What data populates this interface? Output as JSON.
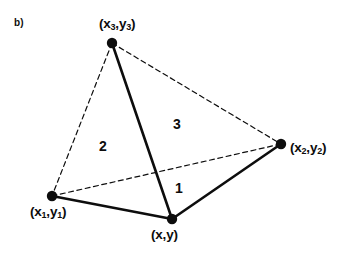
{
  "figure": {
    "panel_letter": "b)",
    "background_color": "#ffffff",
    "stroke_color": "#0d0d0d",
    "vertices": [
      {
        "id": "v3",
        "name": "x3y3",
        "label_text": "(x",
        "label_full": "(x3,y3)",
        "sub_a": "3",
        "mid_text": ",y",
        "sub_b": "3",
        "close_text": ")",
        "cx": 112,
        "cy": 43,
        "r": 5.2,
        "label_x": 99,
        "label_y": 17
      },
      {
        "id": "v2",
        "name": "x2y2",
        "label_text": "(x",
        "label_full": "(x2,y2)",
        "sub_a": "2",
        "mid_text": ",y",
        "sub_b": "2",
        "close_text": ")",
        "cx": 281,
        "cy": 144,
        "r": 5.2,
        "label_x": 290,
        "label_y": 141
      },
      {
        "id": "v1",
        "name": "x1y1",
        "label_text": "(x",
        "label_full": "(x1,y1)",
        "sub_a": "1",
        "mid_text": ",y",
        "sub_b": "1",
        "close_text": ")",
        "cx": 52,
        "cy": 196,
        "r": 5.2,
        "label_x": 30,
        "label_y": 205
      },
      {
        "id": "v0",
        "name": "xy",
        "label_text": "(x",
        "label_full": "(x,y)",
        "sub_a": "",
        "mid_text": ",y",
        "sub_b": "",
        "close_text": ")",
        "cx": 172,
        "cy": 219,
        "r": 5.2,
        "label_x": 151,
        "label_y": 228
      }
    ],
    "edges": [
      {
        "name": "edge-x3y3-to-xy",
        "style": "solid",
        "x1": 112,
        "y1": 43,
        "x2": 172,
        "y2": 219,
        "width": 2.6
      },
      {
        "name": "edge-x1y1-to-xy",
        "style": "solid",
        "x1": 52,
        "y1": 196,
        "x2": 172,
        "y2": 219,
        "width": 2.6
      },
      {
        "name": "edge-xy-to-x2y2",
        "style": "solid",
        "x1": 172,
        "y1": 219,
        "x2": 281,
        "y2": 144,
        "width": 2.6
      },
      {
        "name": "edge-x3y3-to-x1y1",
        "style": "dashed",
        "x1": 112,
        "y1": 43,
        "x2": 52,
        "y2": 196,
        "width": 1.2
      },
      {
        "name": "edge-x3y3-to-x2y2",
        "style": "dashed",
        "x1": 112,
        "y1": 43,
        "x2": 281,
        "y2": 144,
        "width": 1.2
      },
      {
        "name": "edge-x1y1-to-x2y2",
        "style": "dashed",
        "x1": 52,
        "y1": 196,
        "x2": 281,
        "y2": 144,
        "width": 1.2
      }
    ],
    "regions": [
      {
        "name": "region-1",
        "label": "1",
        "x": 175,
        "y": 181
      },
      {
        "name": "region-2",
        "label": "2",
        "x": 99,
        "y": 139
      },
      {
        "name": "region-3",
        "label": "3",
        "x": 173,
        "y": 117
      }
    ]
  }
}
